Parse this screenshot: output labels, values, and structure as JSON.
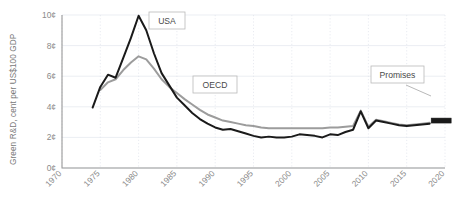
{
  "chart_data": {
    "type": "line",
    "title": "",
    "xlabel": "",
    "ylabel": "Green R&D, cent per US$100 GDP",
    "xlim": [
      1970,
      2020
    ],
    "ylim": [
      0,
      10
    ],
    "y_tick_labels": [
      "0¢",
      "2¢",
      "4¢",
      "6¢",
      "8¢",
      "10¢"
    ],
    "y_tick_values": [
      0,
      2,
      4,
      6,
      8,
      10
    ],
    "x_tick_labels": [
      "1970",
      "1975",
      "1980",
      "1985",
      "1990",
      "1995",
      "2000",
      "2005",
      "2010",
      "2015",
      "2020"
    ],
    "x_tick_values": [
      1970,
      1975,
      1980,
      1985,
      1990,
      1995,
      2000,
      2005,
      2010,
      2015,
      2020
    ],
    "grid": true,
    "legend": "inline-callouts",
    "series": [
      {
        "name": "USA",
        "color": "#1a1a1a",
        "x": [
          1974,
          1975,
          1976,
          1977,
          1978,
          1979,
          1980,
          1981,
          1982,
          1983,
          1984,
          1985,
          1986,
          1987,
          1988,
          1989,
          1990,
          1991,
          1992,
          1993,
          1994,
          1995,
          1996,
          1997,
          1998,
          1999,
          2000,
          2001,
          2002,
          2003,
          2004,
          2005,
          2006,
          2007,
          2008,
          2009,
          2010,
          2011,
          2012,
          2013,
          2014,
          2015,
          2016,
          2017,
          2018
        ],
        "values": [
          3.95,
          5.3,
          6.1,
          5.9,
          7.2,
          8.5,
          9.95,
          9.0,
          7.5,
          6.2,
          5.4,
          4.6,
          4.1,
          3.6,
          3.2,
          2.9,
          2.65,
          2.5,
          2.55,
          2.4,
          2.25,
          2.1,
          2.0,
          2.05,
          2.0,
          2.0,
          2.05,
          2.2,
          2.15,
          2.1,
          2.0,
          2.2,
          2.15,
          2.35,
          2.5,
          3.7,
          2.6,
          3.1,
          3.0,
          2.9,
          2.8,
          2.75,
          2.8,
          2.85,
          2.9
        ]
      },
      {
        "name": "OECD",
        "color": "#9c9c9c",
        "x": [
          1975,
          1976,
          1977,
          1978,
          1979,
          1980,
          1981,
          1982,
          1983,
          1984,
          1985,
          1986,
          1987,
          1988,
          1989,
          1990,
          1991,
          1992,
          1993,
          1994,
          1995,
          1996,
          1997,
          1998,
          1999,
          2000,
          2001,
          2002,
          2003,
          2004,
          2005,
          2006,
          2007,
          2008,
          2009,
          2010,
          2011,
          2012,
          2013,
          2014,
          2015,
          2016,
          2017,
          2018
        ],
        "values": [
          5.1,
          5.6,
          5.8,
          6.4,
          6.9,
          7.3,
          7.1,
          6.5,
          5.8,
          5.3,
          4.9,
          4.5,
          4.15,
          3.8,
          3.5,
          3.3,
          3.1,
          3.0,
          2.9,
          2.8,
          2.75,
          2.65,
          2.6,
          2.6,
          2.6,
          2.6,
          2.6,
          2.6,
          2.6,
          2.6,
          2.65,
          2.65,
          2.7,
          2.75,
          3.75,
          2.7,
          3.15,
          3.05,
          2.95,
          2.85,
          2.8,
          2.85,
          2.9,
          2.95
        ]
      }
    ],
    "annotations": [
      {
        "label": "USA",
        "x": 1983.0,
        "y": 9.6
      },
      {
        "label": "OECD",
        "x": 1989.5,
        "y": 6.0
      },
      {
        "label": "Promises",
        "x": 2014.0,
        "y": 5.0
      }
    ],
    "markers": [
      {
        "name": "promises-marker",
        "x": 2019.5,
        "y": 3.1,
        "color": "#1a1a1a"
      }
    ]
  }
}
